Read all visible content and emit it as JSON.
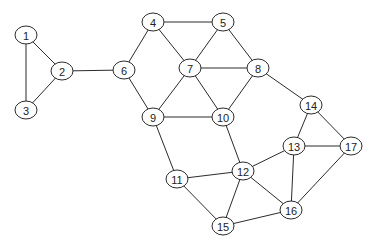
{
  "diagram": {
    "type": "undirected-graph",
    "colors": {
      "stroke": "#2b2b2b",
      "node_fill": "#ffffff",
      "label": "#222222",
      "background": "#ffffff"
    },
    "nodes": [
      {
        "id": "1",
        "label": "1",
        "x": 26,
        "y": 35
      },
      {
        "id": "2",
        "label": "2",
        "x": 62,
        "y": 71
      },
      {
        "id": "3",
        "label": "3",
        "x": 26,
        "y": 110
      },
      {
        "id": "4",
        "label": "4",
        "x": 153,
        "y": 22
      },
      {
        "id": "5",
        "label": "5",
        "x": 223,
        "y": 22
      },
      {
        "id": "6",
        "label": "6",
        "x": 124,
        "y": 70
      },
      {
        "id": "7",
        "label": "7",
        "x": 190,
        "y": 68
      },
      {
        "id": "8",
        "label": "8",
        "x": 258,
        "y": 68
      },
      {
        "id": "9",
        "label": "9",
        "x": 153,
        "y": 117
      },
      {
        "id": "10",
        "label": "10",
        "x": 223,
        "y": 117
      },
      {
        "id": "11",
        "label": "11",
        "x": 177,
        "y": 179
      },
      {
        "id": "12",
        "label": "12",
        "x": 243,
        "y": 171
      },
      {
        "id": "13",
        "label": "13",
        "x": 294,
        "y": 146
      },
      {
        "id": "14",
        "label": "14",
        "x": 311,
        "y": 105
      },
      {
        "id": "15",
        "label": "15",
        "x": 223,
        "y": 226
      },
      {
        "id": "16",
        "label": "16",
        "x": 291,
        "y": 210
      },
      {
        "id": "17",
        "label": "17",
        "x": 351,
        "y": 146
      }
    ],
    "edges": [
      [
        "1",
        "2"
      ],
      [
        "1",
        "3"
      ],
      [
        "2",
        "3"
      ],
      [
        "2",
        "6"
      ],
      [
        "4",
        "5"
      ],
      [
        "4",
        "6"
      ],
      [
        "4",
        "7"
      ],
      [
        "5",
        "7"
      ],
      [
        "5",
        "8"
      ],
      [
        "6",
        "9"
      ],
      [
        "7",
        "8"
      ],
      [
        "7",
        "9"
      ],
      [
        "7",
        "10"
      ],
      [
        "8",
        "10"
      ],
      [
        "8",
        "14"
      ],
      [
        "9",
        "10"
      ],
      [
        "9",
        "11"
      ],
      [
        "10",
        "12"
      ],
      [
        "11",
        "12"
      ],
      [
        "11",
        "15"
      ],
      [
        "12",
        "13"
      ],
      [
        "12",
        "15"
      ],
      [
        "12",
        "16"
      ],
      [
        "13",
        "14"
      ],
      [
        "13",
        "16"
      ],
      [
        "13",
        "17"
      ],
      [
        "14",
        "17"
      ],
      [
        "16",
        "17"
      ],
      [
        "15",
        "16"
      ]
    ]
  }
}
